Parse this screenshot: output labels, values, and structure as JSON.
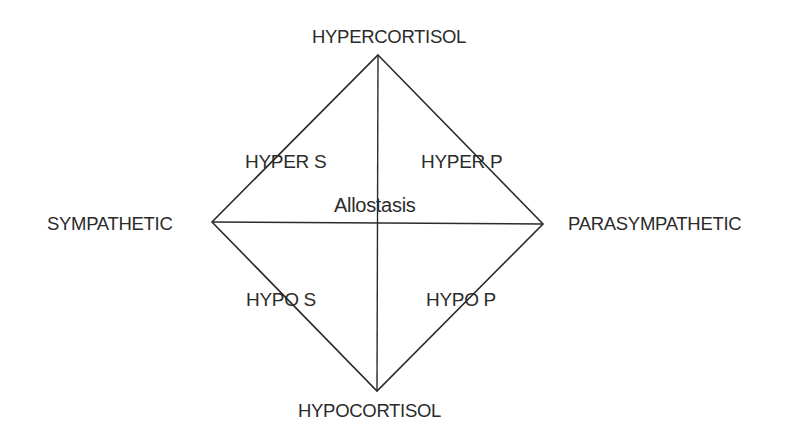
{
  "diagram": {
    "type": "diamond-quadrant",
    "line_color": "#2b2b2b",
    "vertices": {
      "top": {
        "label": "HYPERCORTISOL"
      },
      "bottom": {
        "label": "HYPOCORTISOL"
      },
      "left": {
        "label": "SYMPATHETIC"
      },
      "right": {
        "label": "PARASYMPATHETIC"
      }
    },
    "quadrants": {
      "upper_left": "HYPER S",
      "upper_right": "HYPER P",
      "lower_left": "HYPO S",
      "lower_right": "HYPO P"
    },
    "center": "Allostasis"
  }
}
